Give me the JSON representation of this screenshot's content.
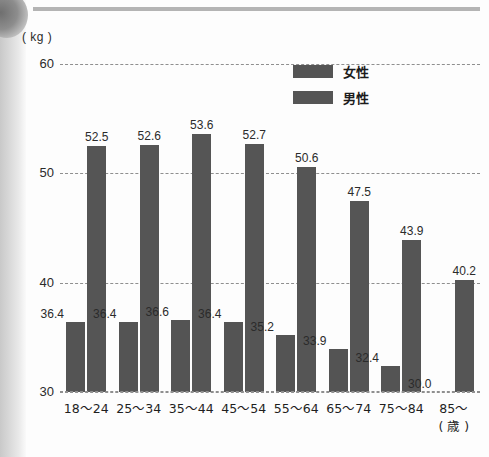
{
  "unit_label": "( kg )",
  "age_unit_label": "( 歳 )",
  "legend": [
    {
      "label": "女性",
      "color": "#545454"
    },
    {
      "label": "男性",
      "color": "#555555"
    }
  ],
  "y_ticks": [
    "60",
    "50",
    "40",
    "30"
  ],
  "chart_data": {
    "type": "bar",
    "title": "",
    "subtitle": "",
    "xlabel": "( 歳 )",
    "ylabel": "( kg )",
    "ylim": [
      30,
      60
    ],
    "y_ticks": [
      30,
      40,
      50,
      60
    ],
    "grid": true,
    "legend_position": "top-right",
    "categories": [
      "18〜24",
      "25〜34",
      "35〜44",
      "45〜54",
      "55〜64",
      "65〜74",
      "75〜84",
      "85〜"
    ],
    "series": [
      {
        "name": "女性",
        "color": "#545454",
        "values": [
          36.4,
          36.4,
          36.6,
          36.4,
          35.2,
          33.9,
          32.4,
          30.0
        ],
        "labels": [
          "36.4",
          "36.4",
          "36.6",
          "36.4",
          "35.2",
          "33.9",
          "32.4",
          "30.0"
        ]
      },
      {
        "name": "男性",
        "color": "#555555",
        "values": [
          52.5,
          52.6,
          53.6,
          52.7,
          50.6,
          47.5,
          43.9,
          40.2
        ],
        "labels": [
          "52.5",
          "52.6",
          "53.6",
          "52.7",
          "50.6",
          "47.5",
          "43.9",
          "40.2"
        ]
      }
    ]
  }
}
